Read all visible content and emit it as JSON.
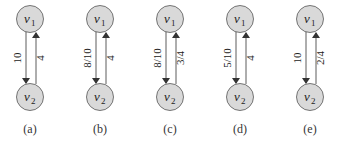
{
  "colors": {
    "node_fill": "#d9d9d9",
    "node_stroke": "#555555",
    "edge_stroke": "#333333",
    "text": "#222222"
  },
  "nodes": {
    "top": {
      "name": "v",
      "sub": "1"
    },
    "bottom": {
      "name": "v",
      "sub": "2"
    }
  },
  "panels": [
    {
      "caption": "(a)",
      "down_label": "10",
      "up_label": "4"
    },
    {
      "caption": "(b)",
      "down_label": "8/10",
      "up_label": "4"
    },
    {
      "caption": "(c)",
      "down_label": "8/10",
      "up_label": "3/4"
    },
    {
      "caption": "(d)",
      "down_label": "5/10",
      "up_label": "4"
    },
    {
      "caption": "(e)",
      "down_label": "10",
      "up_label": "2/4"
    }
  ]
}
